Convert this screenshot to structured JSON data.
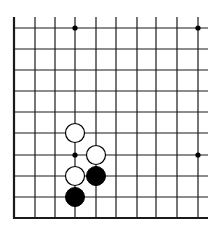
{
  "diagram": {
    "type": "go-board-fragment",
    "background": "#ffffff",
    "line_color": "#1a1a1a",
    "columns_x": [
      14,
      35,
      55,
      75,
      96,
      116,
      137,
      156,
      177,
      198
    ],
    "rows_y": [
      28,
      49,
      70,
      91,
      112,
      133,
      155,
      176,
      197,
      218
    ],
    "vertical_top": 17,
    "horizontal_right": 208,
    "edges": [
      "left",
      "bottom"
    ],
    "star_points": [
      {
        "col": 3,
        "row": 0
      },
      {
        "col": 9,
        "row": 0
      },
      {
        "col": 3,
        "row": 6
      },
      {
        "col": 9,
        "row": 6
      }
    ],
    "stones": [
      {
        "color": "white",
        "col": 3,
        "row": 5
      },
      {
        "color": "white",
        "col": 4,
        "row": 6
      },
      {
        "color": "white",
        "col": 3,
        "row": 7
      },
      {
        "color": "black",
        "col": 4,
        "row": 7
      },
      {
        "color": "black",
        "col": 3,
        "row": 8
      }
    ],
    "stone_radius": 9.5,
    "star_radius": 2.6
  }
}
